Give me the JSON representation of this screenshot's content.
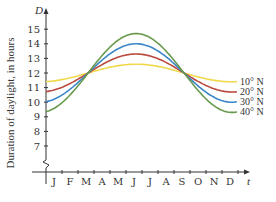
{
  "chart_data": {
    "type": "line",
    "title": "",
    "xlabel": "t",
    "ylabel": "Duration of daylight, in hours",
    "y_axis_symbol": "D",
    "x_axis_symbol": "t",
    "categories": [
      "J",
      "F",
      "M",
      "A",
      "M",
      "J",
      "J",
      "A",
      "S",
      "O",
      "N",
      "D"
    ],
    "yticks": [
      7,
      8,
      9,
      10,
      11,
      12,
      13,
      14,
      15
    ],
    "ylim": [
      6,
      15.8
    ],
    "axis_break": true,
    "grid": false,
    "legend_position": "right-inline",
    "series": [
      {
        "name": "10° N",
        "color": "#f0d84c",
        "mean": 12,
        "amplitude": 0.6,
        "values": [
          11.4,
          11.6,
          11.9,
          12.2,
          12.4,
          12.6,
          12.5,
          12.3,
          12.0,
          11.7,
          11.5,
          11.4
        ]
      },
      {
        "name": "20° N",
        "color": "#b84a3e",
        "mean": 12,
        "amplitude": 1.3,
        "values": [
          10.8,
          11.2,
          11.8,
          12.4,
          12.9,
          13.2,
          13.1,
          12.7,
          12.1,
          11.5,
          11.0,
          10.7
        ]
      },
      {
        "name": "30° N",
        "color": "#3a86c8",
        "mean": 12,
        "amplitude": 2.0,
        "values": [
          10.1,
          10.7,
          11.6,
          12.6,
          13.5,
          14.0,
          13.8,
          13.1,
          12.2,
          11.2,
          10.4,
          10.0
        ]
      },
      {
        "name": "40° N",
        "color": "#6a9a4e",
        "mean": 12,
        "amplitude": 2.7,
        "values": [
          9.4,
          10.2,
          11.5,
          12.9,
          14.0,
          14.7,
          14.5,
          13.5,
          12.3,
          10.9,
          9.8,
          9.2
        ]
      }
    ]
  },
  "axes": {
    "y_symbol": "D",
    "x_symbol": "t",
    "ylabel": "Duration of daylight, in hours"
  }
}
